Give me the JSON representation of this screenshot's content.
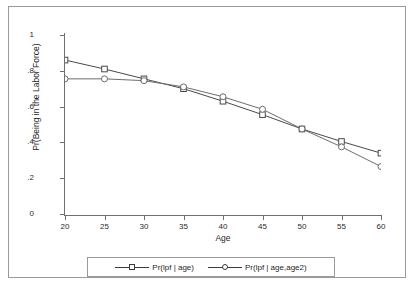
{
  "chart_data": {
    "type": "line",
    "title": "",
    "xlabel": "Age",
    "ylabel": "Pr(Being in the Labor Force)",
    "x": [
      20,
      25,
      30,
      35,
      40,
      45,
      50,
      55,
      60
    ],
    "xlim": [
      20,
      60
    ],
    "ylim": [
      0,
      1
    ],
    "xticks": [
      "20",
      "25",
      "30",
      "35",
      "40",
      "45",
      "50",
      "55",
      "60"
    ],
    "yticks": [
      "0",
      ".2",
      ".4",
      ".6",
      ".8",
      "1"
    ],
    "ytick_values": [
      0,
      0.2,
      0.4,
      0.6,
      0.8,
      1
    ],
    "grid": false,
    "legend_position": "bottom",
    "series": [
      {
        "name": "Pr(lpf | age)",
        "marker": "square",
        "color": "#4a4a4a",
        "values": [
          0.86,
          0.81,
          0.755,
          0.7,
          0.63,
          0.555,
          0.475,
          0.405,
          0.34
        ]
      },
      {
        "name": "Pr(lpf | age,age2)",
        "marker": "circle",
        "color": "#6d6d6d",
        "values": [
          0.755,
          0.755,
          0.745,
          0.71,
          0.655,
          0.585,
          0.475,
          0.375,
          0.265
        ]
      }
    ]
  },
  "legend": {
    "entries": [
      {
        "label": "Pr(lpf | age)"
      },
      {
        "label": "Pr(lpf | age,age2)"
      }
    ]
  }
}
